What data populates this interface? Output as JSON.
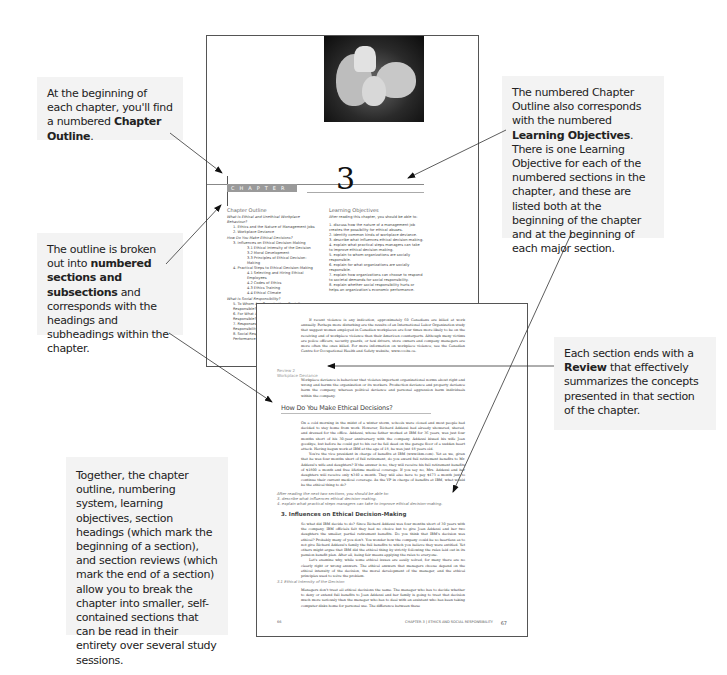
{
  "callouts": {
    "chapter_outline": {
      "pre": "At the beginning of each chapter, you'll find a numbered ",
      "bold": "Chapter Outline",
      "post": "."
    },
    "learning_objectives": {
      "pre": "The numbered Chapter Outline also corresponds with the numbered ",
      "bold": "Learning Objectives",
      "post": ". There is one Learning Objective for each of the numbered sections in the chapter, and these are listed both at the beginning of the chapter and at the beginning of each major section."
    },
    "sections": {
      "pre": "The outline is broken out into ",
      "bold": "numbered sections and subsections",
      "post": " and corresponds with the headings and subheadings within the chapter."
    },
    "review": {
      "pre": "Each section ends with a ",
      "bold": "Review",
      "post": " that effectively summarizes the concepts presented in that section of the chapter."
    },
    "together": {
      "text": "Together, the chapter outline, numbering system, learning objectives, section headings (which mark the beginning of a section), and section reviews (which mark the end of a section) allow you to break the chapter into smaller, self-contained sections that can be read in their entirety over several study sessions."
    }
  },
  "top_page": {
    "chapter_label": "CHAPTER",
    "chapter_number": "3",
    "outline": {
      "title": "Chapter Outline",
      "items": [
        {
          "level": 0,
          "text": "What Is Ethical and Unethical Workplace Behaviour?"
        },
        {
          "level": 1,
          "text": "1. Ethics and the Nature of Management Jobs"
        },
        {
          "level": 1,
          "text": "2. Workplace Deviance"
        },
        {
          "level": 0,
          "text": "How Do You Make Ethical Decisions?"
        },
        {
          "level": 1,
          "text": "3. Influences on Ethical Decision-Making"
        },
        {
          "level": 2,
          "text": "3.1 Ethical Intensity of the Decision"
        },
        {
          "level": 2,
          "text": "3.2 Moral Development"
        },
        {
          "level": 2,
          "text": "3.3 Principles of Ethical Decision-Making"
        },
        {
          "level": 1,
          "text": "4. Practical Steps to Ethical Decision-Making"
        },
        {
          "level": 2,
          "text": "4.1 Selecting and Hiring Ethical Employees"
        },
        {
          "level": 2,
          "text": "4.2 Codes of Ethics"
        },
        {
          "level": 2,
          "text": "4.3 Ethics Training"
        },
        {
          "level": 2,
          "text": "4.4 Ethical Climate"
        },
        {
          "level": 0,
          "text": "What Is Social Responsibility?"
        },
        {
          "level": 1,
          "text": "5. To Whom Are Organizations Socially Responsible?"
        },
        {
          "level": 1,
          "text": "6. For What Are Organizations Socially Responsible?"
        },
        {
          "level": 1,
          "text": "7. Responses to Demands for Social Responsibility"
        },
        {
          "level": 1,
          "text": "8. Social Responsibility and Economic Performance"
        }
      ]
    },
    "objectives": {
      "title": "Learning Objectives",
      "intro": "After reading this chapter, you should be able to:",
      "items": [
        "1. discuss how the nature of a management job creates the possibility for ethical abuses.",
        "2. identify common kinds of workplace deviance.",
        "3. describe what influences ethical decision-making.",
        "4. explain what practical steps managers can take to improve ethical decision-making.",
        "5. explain to whom organizations are socially responsible.",
        "6. explain for what organizations are socially responsible.",
        "7. explain how organizations can choose to respond to societal demands for social responsibility.",
        "8. explain whether social responsibility hurts or helps an organization's economic performance."
      ]
    }
  },
  "bottom_page": {
    "intro_paragraph": "If recent violence is any indication, approximately 60 Canadians are killed at work annually. Perhaps more disturbing are the results of an International Labor Organization study that suggest women employed in Canadian workplaces are four times more likely to be on the receiving end of workplace violence than their American counterparts. Although many victims are police officers, security guards, or taxi drivers, store owners and company managers are more often the ones killed. For more information on workplace violence, see the Canadian Centre for Occupational Health and Safety website, www.ccohs.ca.",
    "review_label": "Review 2",
    "review_title": "Workplace Deviance",
    "review_text": "Workplace deviance is behaviour that violates important organizational norms about right and wrong and harms the organization or its workers. Production deviance and property deviance harm the company, whereas political deviance and personal aggression harm individuals within the company.",
    "section_heading": "How Do You Make Ethical Decisions?",
    "section_p1": "On a cold morning in the midst of a winter storm, schools were closed and most people had decided to stay home from work. However, Richard Addessi had already showered, shaved, and dressed for the office. Addessi, whose father worked at IBM for 36 years, was just four months short of his 30-year anniversary with the company. Addessi kissed his wife Joan goodbye, but before he could get to his car he fell dead on the garage floor of a sudden heart attack. Having begun work at IBM at the age of 18, he was just 48 years old.",
    "section_p2": "You're the vice president in charge of benefits at IBM (www.ibm.com). Yet as we, given that he was four months short of full retirement, do you award full retirement benefits to Mr. Addessi's wife and daughters? If the answer is no, they will receive his full retirement benefits of $1800 a month and free lifetime medical coverage. If you say no, Mrs. Addessi and her daughters will receive only $340 a month. They will also have to pay $473 a month just to continue their current medical coverage. As the VP in charge of benefits at IBM, what would be the ethical thing to do?",
    "lo_intro": "After reading the next two sections, you should be able to:",
    "lo_items": [
      "3. describe what influences ethical decision-making.",
      "4. explain what practical steps managers can take to improve ethical decision-making."
    ],
    "subsection_heading": "3. Influences on Ethical Decision-Making",
    "sub_p1": "So what did IBM decide to do? Since Richard Addessi was four months short of 30 years with the company, IBM officials felt they had no choice but to give Joan Addessi and her two daughters the smaller, partial retirement benefits. Do you think that IBM's decision was ethical? Probably many of you don't. You wonder how the company could be so heartless as to not give Richard Addessi's family the full benefits to which you believe they were entitled. Yet others might argue that IBM did the ethical thing by strictly following the rules laid out in its pension benefit plan. After all, being fair means applying the rules to everyone.",
    "sub_p2": "Let's examine why, while some ethical issues are easily solved, for many there are no clearly right or wrong answers. The ethical answers that managers choose depend on the ethical intensity of the decision, the moral development of the manager, and the ethical principles used to solve the problem.",
    "subsub_heading": "3.1 Ethical Intensity of the Decision",
    "subsub_p": "Managers don't treat all ethical decisions the same. The manager who has to decide whether to deny or extend full benefits to Joan Addessi and her family is going to treat that decision much more seriously than the manager who has to deal with an assistant who has been taking computer disks home for personal use. The difference between these",
    "footer_left": "66",
    "footer_chapter": "CHAPTER 3",
    "footer_title": "ETHICS AND SOCIAL RESPONSIBILITY",
    "footer_page": "67"
  },
  "colors": {
    "callout_bg": "#f3f3f3",
    "text": "#222222",
    "page_border": "#555555",
    "chapter_bar": "#9a9a9a"
  }
}
